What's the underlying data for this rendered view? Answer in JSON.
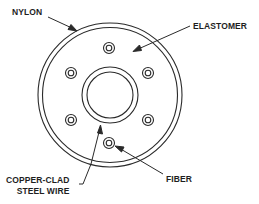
{
  "diagram": {
    "labels": {
      "nylon": "NYLON",
      "elastomer": "ELASTOMER",
      "copper_line1": "COPPER-CLAD",
      "copper_line2": "STEEL WIRE",
      "fiber": "FIBER"
    },
    "components": [
      {
        "name": "Nylon outer jacket",
        "shape": "double ring",
        "outer_radius": 72,
        "inner_radius": 67
      },
      {
        "name": "Elastomer fill",
        "shape": "region between jacket and wire"
      },
      {
        "name": "Copper-clad steel wire",
        "shape": "double ring",
        "outer_radius": 28,
        "inner_radius": 23
      },
      {
        "name": "Fibers",
        "count": 6,
        "shape": "small double circles"
      }
    ],
    "colors": {
      "stroke": "#2a2a2a",
      "background": "#ffffff",
      "text": "#1e1e1e"
    }
  }
}
